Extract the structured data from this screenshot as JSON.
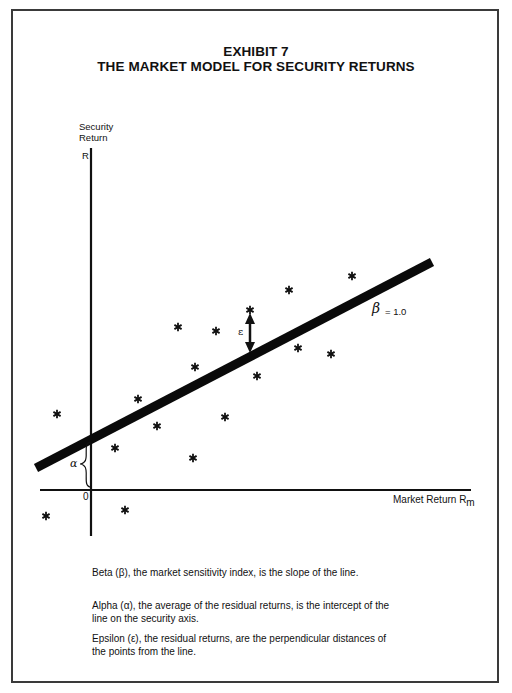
{
  "header": {
    "exhibit": "EXHIBIT 7",
    "title": "THE MARKET MODEL FOR SECURITY RETURNS"
  },
  "chart_data": {
    "type": "scatter",
    "xlabel": "Market Return R_m",
    "ylabel": "Security Return R",
    "origin_label": "0",
    "grid": false,
    "legend": "none",
    "series": [
      {
        "name": "Security returns (asterisks)",
        "points_px": [
          [
            57,
            414
          ],
          [
            46,
            516
          ],
          [
            115,
            448
          ],
          [
            125,
            510
          ],
          [
            138,
            399
          ],
          [
            157,
            426
          ],
          [
            178,
            327
          ],
          [
            193,
            458
          ],
          [
            195,
            367
          ],
          [
            216,
            331
          ],
          [
            225,
            417
          ],
          [
            250,
            310
          ],
          [
            257,
            376
          ],
          [
            289,
            290
          ],
          [
            298,
            348
          ],
          [
            331,
            354
          ],
          [
            352,
            276
          ]
        ]
      }
    ],
    "regression_line": {
      "label": "β = 1.0",
      "slope": 1.0,
      "from_px": [
        36,
        468
      ],
      "to_px": [
        432,
        262
      ]
    },
    "annotations": [
      {
        "symbol": "α",
        "meaning": "intercept of line on security axis (brace between origin and line)"
      },
      {
        "symbol": "ε",
        "meaning": "residual: distance of point from line (double arrow)"
      },
      {
        "symbol": "β = 1.0",
        "meaning": "slope of the line"
      }
    ]
  },
  "axes": {
    "y_label_line1": "Security",
    "y_label_line2": "Return",
    "y_symbol": "R",
    "x_label": "Market Return R",
    "x_subscript": "m",
    "origin": "0",
    "alpha": "α",
    "epsilon": "ε",
    "beta_label": "β",
    "beta_value": "= 1.0"
  },
  "captions": [
    "Beta (β), the market sensitivity index, is the slope of the line.",
    "Alpha (α), the average of the residual returns, is the intercept of the line on the security axis.",
    "Epsilon (ε), the residual returns, are the perpendicular distances of the points from the line."
  ]
}
